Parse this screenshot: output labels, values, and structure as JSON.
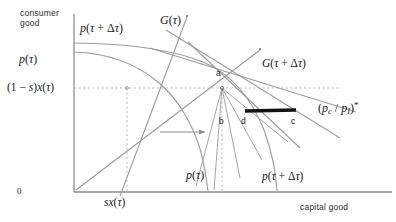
{
  "figure": {
    "type": "diagram",
    "axes": {
      "y_axis_label": "consumer good",
      "x_axis_label": "capital good",
      "origin_label": "0",
      "y_ticks": [
        {
          "id": "p-tau",
          "text": "p(τ)"
        },
        {
          "id": "one-minus-s-x-tau",
          "text": "(1 − s)x(τ)"
        }
      ],
      "x_ticks": [
        {
          "id": "sx-tau",
          "text": "sx(τ)"
        }
      ]
    },
    "curve_labels": [
      {
        "id": "p-tau-plus-delta-tau-top",
        "text": "p(τ + Δτ)"
      },
      {
        "id": "g-tau",
        "text": "G(τ)"
      },
      {
        "id": "g-tau-plus-delta-tau",
        "text": "G(τ + Δτ)"
      },
      {
        "id": "price-ratio-star",
        "text": "(p_c / p_I)*"
      },
      {
        "id": "p-tau-bottom",
        "text": "p(τ)"
      },
      {
        "id": "p-tau-plus-delta-tau-bottom",
        "text": "p(τ + Δτ)"
      }
    ],
    "points": [
      {
        "id": "a",
        "label": "a"
      },
      {
        "id": "b",
        "label": "b"
      },
      {
        "id": "c",
        "label": "c"
      },
      {
        "id": "d",
        "label": "d"
      }
    ],
    "annotations": [
      {
        "id": "shift-arrow",
        "label": "rightward shift arrow"
      },
      {
        "id": "bold-segment",
        "label": "bold price-ratio segment between d and c"
      }
    ],
    "colors": {
      "axis": "#8e8e8e",
      "curve": "#9a9a9a",
      "dashed": "#b0b0b0",
      "bold_segment": "#111111",
      "text": "#1a1a1a"
    }
  }
}
